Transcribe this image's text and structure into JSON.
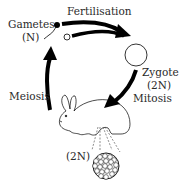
{
  "diagram": {
    "labels": {
      "gametes": "Gametes",
      "gametes_ploidy": "(N)",
      "fertilisation": "Fertilisation",
      "zygote": "Zygote",
      "zygote_ploidy": "(2N)",
      "mitosis": "Mitosis",
      "meiosis": "Meiosis",
      "body_ploidy": "(2N)"
    },
    "nodes": [
      {
        "id": "gametes",
        "label": "Gametes (N)",
        "icons": [
          "sperm-icon",
          "egg-icon"
        ]
      },
      {
        "id": "zygote",
        "label": "Zygote (2N)",
        "icon": "zygote-cell-icon"
      },
      {
        "id": "rabbit",
        "label": "(2N)",
        "icon": "rabbit-icon",
        "detail": "tissue-cells-icon"
      }
    ],
    "edges": [
      {
        "from": "gametes",
        "to": "zygote",
        "label": "Fertilisation"
      },
      {
        "from": "zygote",
        "to": "rabbit",
        "label": "Mitosis"
      },
      {
        "from": "rabbit",
        "to": "gametes",
        "label": "Meiosis"
      }
    ],
    "colors": {
      "ink": "#000000",
      "text": "#2a2a2a",
      "background": "#ffffff"
    }
  }
}
